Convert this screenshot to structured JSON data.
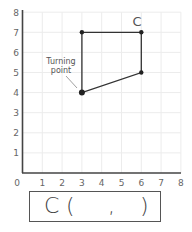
{
  "chart_data": {
    "type": "scatter",
    "title": "",
    "xlabel": "",
    "ylabel": "",
    "xlim": [
      0,
      8
    ],
    "ylim": [
      0,
      8
    ],
    "grid": true,
    "x_ticks": [
      "0",
      "1",
      "2",
      "3",
      "4",
      "5",
      "6",
      "7",
      "8"
    ],
    "y_ticks": [
      "1",
      "2",
      "3",
      "4",
      "5",
      "6",
      "7",
      "8"
    ],
    "shape": {
      "vertices": [
        {
          "x": 3,
          "y": 4
        },
        {
          "x": 3,
          "y": 7
        },
        {
          "x": 6,
          "y": 7
        },
        {
          "x": 6,
          "y": 5
        }
      ],
      "closed": true
    },
    "annotations": [
      {
        "text": "C",
        "x": 6,
        "y": 7,
        "position": "above"
      },
      {
        "text": "Turning point",
        "x": 3,
        "y": 4,
        "position": "upper-left",
        "pointer": true
      }
    ]
  },
  "labels": {
    "vertex_c": "C",
    "turning_line1": "Turning",
    "turning_line2": "point",
    "origin": "0"
  },
  "answer": {
    "prefix": "C",
    "open_paren": "(",
    "comma": ",",
    "close_paren": ")",
    "x_value": "",
    "y_value": ""
  }
}
